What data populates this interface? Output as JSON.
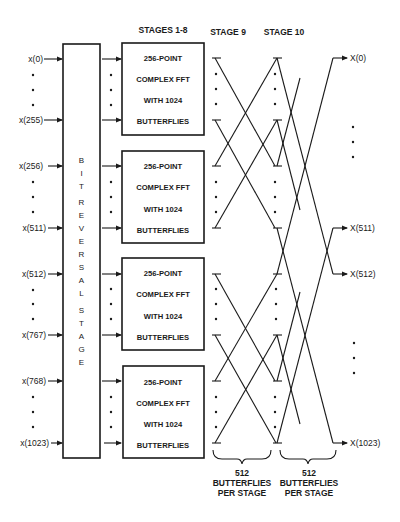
{
  "headers": {
    "stages_1_8": "STAGES 1-8",
    "stage_9": "STAGE 9",
    "stage_10": "STAGE 10"
  },
  "inputs": [
    {
      "first": "x(0)",
      "last": "x(255)"
    },
    {
      "first": "x(256)",
      "last": "x(511)"
    },
    {
      "first": "x(512)",
      "last": "x(767)"
    },
    {
      "first": "x(768)",
      "last": "x(1023)"
    }
  ],
  "bit_reversal": {
    "letters": [
      "B",
      "I",
      "T",
      "",
      "R",
      "E",
      "V",
      "E",
      "R",
      "S",
      "A",
      "L",
      "",
      "S",
      "T",
      "A",
      "G",
      "E"
    ],
    "label": "BIT REVERSAL STAGE"
  },
  "fft_blocks": [
    {
      "line1": "256-POINT",
      "line2": "COMPLEX FFT",
      "line3": "WITH 1024",
      "line4": "BUTTERFLIES"
    },
    {
      "line1": "256-POINT",
      "line2": "COMPLEX FFT",
      "line3": "WITH 1024",
      "line4": "BUTTERFLIES"
    },
    {
      "line1": "256-POINT",
      "line2": "COMPLEX FFT",
      "line3": "WITH 1024",
      "line4": "BUTTERFLIES"
    },
    {
      "line1": "256-POINT",
      "line2": "COMPLEX FFT",
      "line3": "WITH 1024",
      "line4": "BUTTERFLIES"
    }
  ],
  "outputs": [
    "X(0)",
    "X(511)",
    "X(512)",
    "X(1023)"
  ],
  "braces": [
    {
      "line1": "512",
      "line2": "BUTTERFLIES",
      "line3": "PER STAGE"
    },
    {
      "line1": "512",
      "line2": "BUTTERFLIES",
      "line3": "PER STAGE"
    }
  ]
}
